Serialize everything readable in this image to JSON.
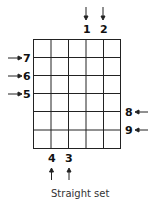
{
  "diagram": {
    "caption": "Straight set",
    "grid": {
      "columns": 5,
      "rows": 6
    },
    "labels": {
      "top": [
        "1",
        "2"
      ],
      "left": [
        "7",
        "6",
        "5"
      ],
      "right": [
        "8",
        "9"
      ],
      "bottom": [
        "4",
        "3"
      ]
    }
  }
}
